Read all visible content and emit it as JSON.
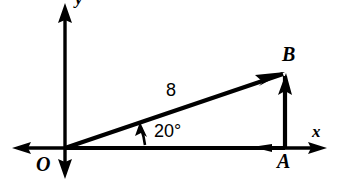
{
  "figure": {
    "background_color": "#ffffff",
    "stroke_color": "#000000",
    "width": 350,
    "height": 187,
    "labels": {
      "origin": "O",
      "point_a": "A",
      "point_b": "B",
      "x_axis": "x",
      "y_axis": "y",
      "magnitude": "8",
      "angle": "20°"
    },
    "geometry": {
      "origin_px": [
        65,
        148
      ],
      "point_a_px": [
        285,
        148
      ],
      "point_b_px": [
        285,
        73
      ],
      "x_axis_left_tip_px": [
        12,
        148
      ],
      "x_axis_right_tip_px": [
        327,
        148
      ],
      "y_axis_top_tip_px": [
        65,
        3
      ],
      "y_axis_bottom_tip_px": [
        65,
        179
      ],
      "angle_degrees": 20,
      "hypotenuse_length_label": "8"
    },
    "vectors": [
      {
        "name": "resultant-vector-OB",
        "from": "O",
        "to": "B",
        "label": "8",
        "arrowhead": "at-B"
      },
      {
        "name": "horizontal-component-OA",
        "from": "O",
        "to": "A",
        "label": "",
        "arrowhead": "mid-right"
      },
      {
        "name": "vertical-component-AB",
        "from": "A",
        "to": "B",
        "label": "",
        "arrowhead": "at-B"
      }
    ]
  }
}
